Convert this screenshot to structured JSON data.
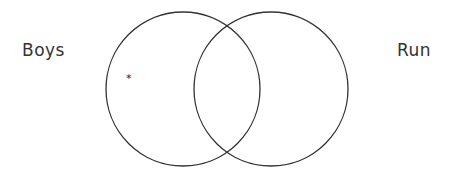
{
  "diagram": {
    "type": "venn",
    "sets": [
      {
        "label": "Boys",
        "cx": 183,
        "cy": 89,
        "r": 77
      },
      {
        "label": "Run",
        "cx": 271,
        "cy": 89,
        "r": 77
      }
    ],
    "marker": {
      "symbol": "*",
      "x": 126,
      "y": 72,
      "region": "Boys only"
    },
    "stroke_color": "#333333"
  }
}
